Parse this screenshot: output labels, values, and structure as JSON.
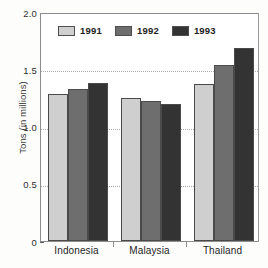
{
  "chart_data": {
    "type": "bar",
    "title": "",
    "xlabel": "",
    "ylabel": "Tons (in millions)",
    "categories": [
      "Indonesia",
      "Malaysia",
      "Thailand"
    ],
    "series": [
      {
        "name": "1991",
        "color": "#cfcfcf",
        "values": [
          1.28,
          1.25,
          1.37
        ]
      },
      {
        "name": "1992",
        "color": "#6e6e6e",
        "values": [
          1.33,
          1.22,
          1.54
        ]
      },
      {
        "name": "1993",
        "color": "#333333",
        "values": [
          1.38,
          1.2,
          1.69
        ]
      }
    ],
    "ylim": [
      0,
      2.0
    ],
    "yticks": [
      {
        "value": 2.0,
        "label": "2.0"
      },
      {
        "value": 1.5,
        "label": "1.5"
      },
      {
        "value": 1.0,
        "label": "1.0"
      },
      {
        "value": 0.5,
        "label": "0.5"
      },
      {
        "value": 0.0,
        "label": "0"
      }
    ],
    "gridlines": [
      1.5,
      1.0,
      0.5
    ],
    "grid": true,
    "legend_position": "top-center"
  }
}
